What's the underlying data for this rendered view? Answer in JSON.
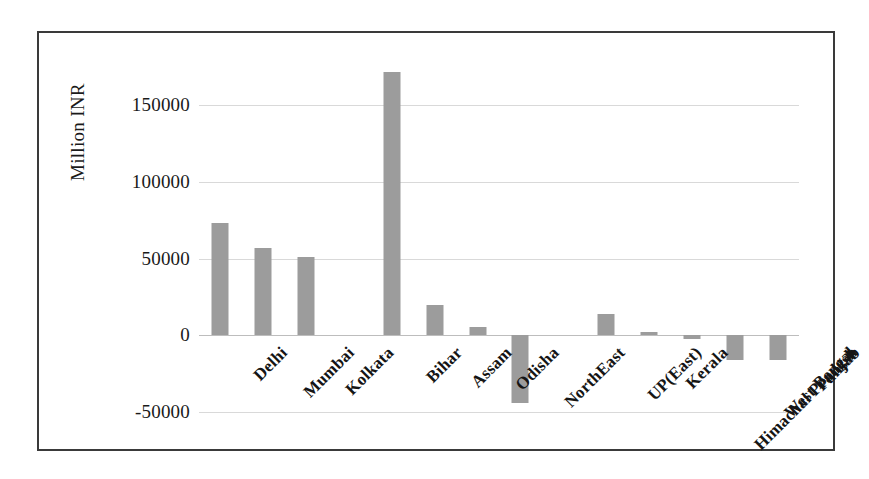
{
  "chart_data": {
    "type": "bar",
    "title": "",
    "xlabel": "",
    "ylabel": "Million INR",
    "ylim": [
      -50000,
      175000
    ],
    "yticks": [
      150000,
      100000,
      50000,
      0,
      -50000
    ],
    "ytick_labels": [
      "150000",
      "100000",
      "50000",
      "0",
      "-50000"
    ],
    "grid": true,
    "legend": "none",
    "bar_color": "#9c9c9c",
    "categories": [
      "Delhi",
      "Mumbai",
      "Kolkata",
      "",
      "Bihar",
      "Assam",
      "Odisha",
      "NorthEast",
      "",
      "UP(East)",
      "Kerala",
      "Himachal Pradesh",
      "West Bengal",
      "Punjab"
    ],
    "values": [
      73000,
      57000,
      51000,
      null,
      172000,
      20000,
      5500,
      -44000,
      null,
      14000,
      2500,
      -2500,
      -16000,
      -16000
    ],
    "series": [
      {
        "name": "Million INR",
        "points": [
          {
            "category": "Delhi",
            "value": 73000
          },
          {
            "category": "Mumbai",
            "value": 57000
          },
          {
            "category": "Kolkata",
            "value": 51000
          },
          {
            "category": "",
            "value": null
          },
          {
            "category": "Bihar",
            "value": 172000
          },
          {
            "category": "Assam",
            "value": 20000
          },
          {
            "category": "Odisha",
            "value": 5500
          },
          {
            "category": "NorthEast",
            "value": -44000
          },
          {
            "category": "",
            "value": null
          },
          {
            "category": "UP(East)",
            "value": 14000
          },
          {
            "category": "Kerala",
            "value": 2500
          },
          {
            "category": "Himachal Pradesh",
            "value": -2500
          },
          {
            "category": "West Bengal",
            "value": -16000
          },
          {
            "category": "Punjab",
            "value": -16000
          }
        ]
      }
    ]
  }
}
